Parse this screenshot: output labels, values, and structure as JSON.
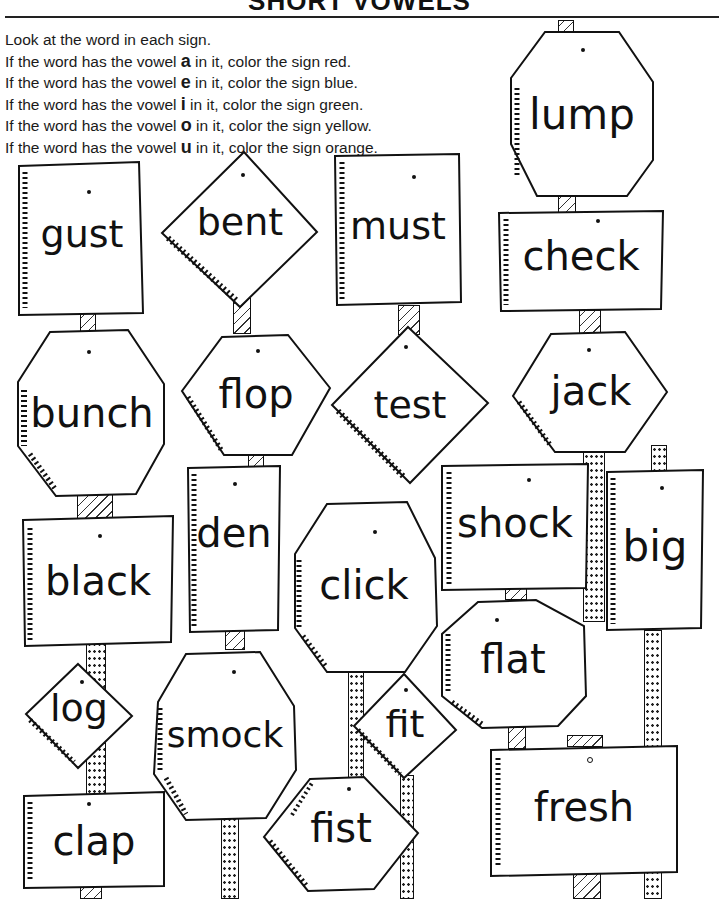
{
  "header": {
    "title": "SHORT VOWELS"
  },
  "instructions": {
    "intro": "Look at the word in each sign.",
    "rules": [
      {
        "prefix": "If the word has the vowel ",
        "vowel": "a",
        "suffix": " in it, color the sign red.",
        "color_name": "red",
        "color": "#e53935"
      },
      {
        "prefix": "If the word has the vowel ",
        "vowel": "e",
        "suffix": " in it, color the sign blue.",
        "color_name": "blue",
        "color": "#1e5fd6"
      },
      {
        "prefix": "If the word has the vowel ",
        "vowel": "i",
        "suffix": " in it, color the sign green.",
        "color_name": "green",
        "color": "#2e9e44"
      },
      {
        "prefix": "If the word has the vowel ",
        "vowel": "o",
        "suffix": " in it, color the sign yellow.",
        "color_name": "yellow",
        "color": "#f5d300"
      },
      {
        "prefix": "If the word has the vowel ",
        "vowel": "u",
        "suffix": " in it, color the sign orange.",
        "color_name": "orange",
        "color": "#f28c1b"
      }
    ]
  },
  "signs": [
    {
      "word": "lump",
      "shape": "octagon"
    },
    {
      "word": "gust",
      "shape": "rectangle"
    },
    {
      "word": "bent",
      "shape": "diamond"
    },
    {
      "word": "must",
      "shape": "rectangle"
    },
    {
      "word": "check",
      "shape": "rectangle"
    },
    {
      "word": "bunch",
      "shape": "octagon"
    },
    {
      "word": "flop",
      "shape": "hexagon"
    },
    {
      "word": "test",
      "shape": "diamond"
    },
    {
      "word": "jack",
      "shape": "hexagon"
    },
    {
      "word": "shock",
      "shape": "rectangle"
    },
    {
      "word": "big",
      "shape": "rectangle"
    },
    {
      "word": "black",
      "shape": "rectangle"
    },
    {
      "word": "den",
      "shape": "rectangle"
    },
    {
      "word": "click",
      "shape": "octagon"
    },
    {
      "word": "flat",
      "shape": "octagon"
    },
    {
      "word": "log",
      "shape": "diamond"
    },
    {
      "word": "smock",
      "shape": "octagon"
    },
    {
      "word": "fit",
      "shape": "diamond"
    },
    {
      "word": "fist",
      "shape": "hexagon"
    },
    {
      "word": "clap",
      "shape": "rectangle"
    },
    {
      "word": "fresh",
      "shape": "rectangle"
    }
  ]
}
